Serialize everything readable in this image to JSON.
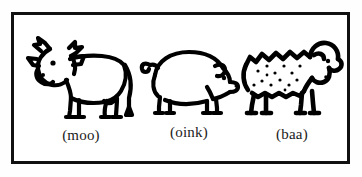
{
  "illustration": {
    "title": "Farm animals with sound labels",
    "frame": {
      "border_color": "#111111",
      "background_color": "#ffffff"
    },
    "ink_color": "#000000",
    "text_color": "#1b1b1b",
    "figures": [
      {
        "animal": "cow",
        "icon": "cow-line-drawing-icon",
        "label": "(moo)",
        "sound": "moo",
        "facing": "left",
        "features": "horns, ears, thick tail, four hooved legs"
      },
      {
        "animal": "pig",
        "icon": "pig-line-drawing-icon",
        "label": "(oink)",
        "sound": "oink",
        "facing": "right",
        "features": "round body, curly tail, snout, floppy ear"
      },
      {
        "animal": "sheep",
        "icon": "sheep-line-drawing-icon",
        "label": "(baa)",
        "sound": "baa",
        "facing": "right",
        "features": "fluffy woolly outline, speckled fleece dots, four legs"
      }
    ]
  }
}
